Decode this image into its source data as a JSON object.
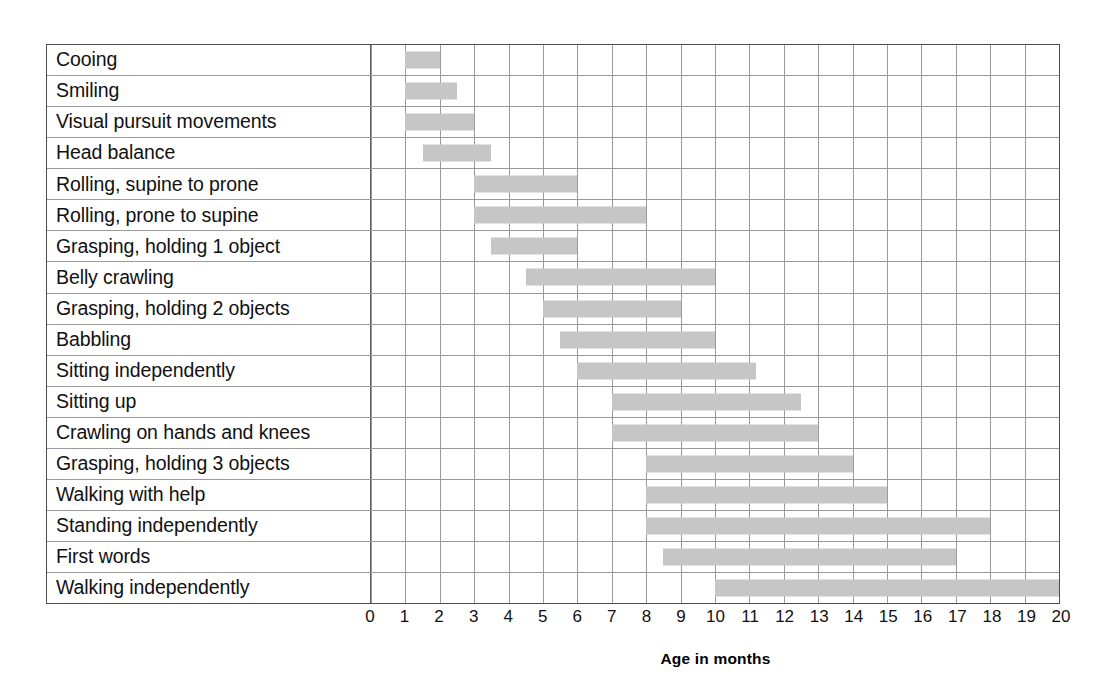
{
  "chart_data": {
    "type": "bar",
    "subtype": "gantt-range",
    "title": "",
    "xlabel": "Age in months",
    "ylabel": "",
    "xlim": [
      0,
      20
    ],
    "xticks": [
      0,
      1,
      2,
      3,
      4,
      5,
      6,
      7,
      8,
      9,
      10,
      11,
      12,
      13,
      14,
      15,
      16,
      17,
      18,
      19,
      20
    ],
    "xtick_labels": [
      "0",
      "1",
      "2",
      "3",
      "4",
      "5",
      "6",
      "7",
      "8",
      "9",
      "10",
      "11",
      "12",
      "13",
      "14",
      "15",
      "16",
      "17",
      "18",
      "19",
      "20"
    ],
    "grid": true,
    "legend": null,
    "bar_color": "#c6c6c6",
    "grid_color": "#9a9a9a",
    "border_color": "#4d4d4d",
    "categories": [
      "Cooing",
      "Smiling",
      "Visual pursuit movements",
      "Head balance",
      "Rolling, supine to prone",
      "Rolling, prone to supine",
      "Grasping, holding 1 object",
      "Belly crawling",
      "Grasping, holding 2 objects",
      "Babbling",
      "Sitting independently",
      "Sitting up",
      "Crawling on hands and knees",
      "Grasping, holding 3 objects",
      "Walking with help",
      "Standing independently",
      "First words",
      "Walking independently"
    ],
    "ranges": [
      {
        "label": "Cooing",
        "start": 1.0,
        "end": 2.0
      },
      {
        "label": "Smiling",
        "start": 1.0,
        "end": 2.5
      },
      {
        "label": "Visual pursuit movements",
        "start": 1.0,
        "end": 3.0
      },
      {
        "label": "Head balance",
        "start": 1.5,
        "end": 3.5
      },
      {
        "label": "Rolling, supine to prone",
        "start": 3.0,
        "end": 6.0
      },
      {
        "label": "Rolling, prone to supine",
        "start": 3.0,
        "end": 8.0
      },
      {
        "label": "Grasping, holding 1 object",
        "start": 3.5,
        "end": 6.0
      },
      {
        "label": "Belly crawling",
        "start": 4.5,
        "end": 10.0
      },
      {
        "label": "Grasping, holding 2 objects",
        "start": 5.0,
        "end": 9.0
      },
      {
        "label": "Babbling",
        "start": 5.5,
        "end": 10.0
      },
      {
        "label": "Sitting independently",
        "start": 6.0,
        "end": 11.2
      },
      {
        "label": "Sitting up",
        "start": 7.0,
        "end": 12.5
      },
      {
        "label": "Crawling on hands and knees",
        "start": 7.0,
        "end": 13.0
      },
      {
        "label": "Grasping, holding 3 objects",
        "start": 8.0,
        "end": 14.0
      },
      {
        "label": "Walking with help",
        "start": 8.0,
        "end": 15.0
      },
      {
        "label": "Standing independently",
        "start": 8.0,
        "end": 18.0
      },
      {
        "label": "First words",
        "start": 8.5,
        "end": 17.0
      },
      {
        "label": "Walking independently",
        "start": 10.0,
        "end": 20.0
      }
    ]
  }
}
